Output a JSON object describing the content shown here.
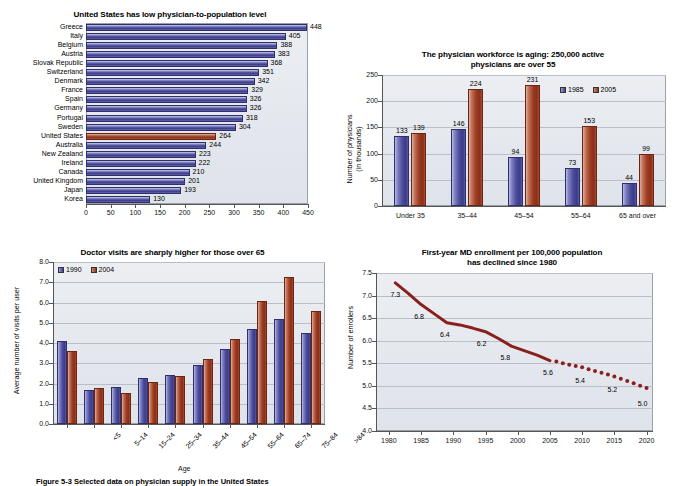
{
  "figure": {
    "caption": "Figure 5-3 Selected data on physician supply in the United States"
  },
  "charts": [
    {
      "id": "chart1",
      "title": "United States has low physician-to-population level",
      "right_axis_note": "",
      "xlabel": "",
      "xticks": [
        "0",
        "50",
        "100",
        "150",
        "200",
        "250",
        "300",
        "350",
        "400",
        "450"
      ]
    },
    {
      "id": "chart2",
      "title_line1": "The physician workforce is aging: 250,000 active",
      "title_line2": "physicians are over 55",
      "ylabel_line1": "Number of physicians",
      "ylabel_line2": "(in thousands)",
      "yticks": [
        "250",
        "200",
        "150",
        "100",
        "50",
        "0"
      ],
      "legend": [
        "1985",
        "2005"
      ]
    },
    {
      "id": "chart3",
      "title": "Doctor visits are sharply higher for those over 65",
      "ylabel": "Average number of visits per user",
      "xlabel": "Age",
      "yticks": [
        "8.0",
        "7.0",
        "6.0",
        "5.0",
        "4.0",
        "3.0",
        "2.0",
        "1.0",
        "0.0"
      ],
      "legend": [
        "1990",
        "2004"
      ]
    },
    {
      "id": "chart4",
      "title_line1": "First-year MD enrollment per 100,000 population",
      "title_line2": "has declined since 1980",
      "ylabel": "Number of enrollers",
      "yticks": [
        "7.5",
        "7.0",
        "6.5",
        "6.0",
        "5.5",
        "5.0",
        "4.5",
        "4.0"
      ],
      "xticks": [
        "1980",
        "1985",
        "1990",
        "1995",
        "2000",
        "2005",
        "2010",
        "2015",
        "2020"
      ]
    }
  ],
  "chart_data": [
    {
      "type": "bar",
      "orientation": "horizontal",
      "title": "United States has low physician-to-population level",
      "xlabel": "",
      "ylabel": "",
      "xlim": [
        0,
        450
      ],
      "grid": false,
      "highlight_category": "United States",
      "highlight_color": "#9d3d24",
      "bar_color": "#4a4a99",
      "categories": [
        "Greece",
        "Italy",
        "Belgium",
        "Austria",
        "Slovak Republic",
        "Switzerland",
        "Denmark",
        "France",
        "Spain",
        "Germany",
        "Portugal",
        "Sweden",
        "United States",
        "Australia",
        "New Zealand",
        "Ireland",
        "Canada",
        "United Kingdom",
        "Japan",
        "Korea"
      ],
      "values": [
        448,
        405,
        388,
        383,
        368,
        351,
        342,
        329,
        326,
        326,
        318,
        304,
        264,
        244,
        223,
        222,
        210,
        201,
        193,
        130
      ],
      "xticks": [
        0,
        50,
        100,
        150,
        200,
        250,
        300,
        350,
        400,
        450
      ]
    },
    {
      "type": "bar",
      "orientation": "vertical",
      "title": "The physician workforce is aging: 250,000 active physicians are over 55",
      "xlabel": "",
      "ylabel": "Number of physicians (in thousands)",
      "ylim": [
        0,
        250
      ],
      "yticks": [
        0,
        50,
        100,
        150,
        200,
        250
      ],
      "grid": true,
      "legend_position": "top-right",
      "categories": [
        "Under 35",
        "35–44",
        "45–54",
        "55–64",
        "65 and over"
      ],
      "series": [
        {
          "name": "1985",
          "color": "#4c4d9c",
          "values": [
            133,
            146,
            94,
            73,
            44
          ]
        },
        {
          "name": "2005",
          "color": "#9c3b22",
          "values": [
            139,
            224,
            231,
            153,
            99
          ]
        }
      ]
    },
    {
      "type": "bar",
      "orientation": "vertical",
      "title": "Doctor visits are sharply higher for those over 65",
      "xlabel": "Age",
      "ylabel": "Average number of visits per user",
      "ylim": [
        0,
        8.0
      ],
      "yticks": [
        0.0,
        1.0,
        2.0,
        3.0,
        4.0,
        5.0,
        6.0,
        7.0,
        8.0
      ],
      "grid": true,
      "legend_position": "top-left",
      "categories": [
        "<5",
        "5–14",
        "15–24",
        "25–34",
        "35–44",
        "45–54",
        "55–64",
        "65–74",
        "75–84",
        ">84"
      ],
      "series": [
        {
          "name": "1990",
          "color": "#4c4d9c",
          "values": [
            4.1,
            1.7,
            1.85,
            2.25,
            2.4,
            2.9,
            3.7,
            4.7,
            5.2,
            4.5
          ]
        },
        {
          "name": "2004",
          "color": "#9c3b22",
          "values": [
            3.6,
            1.8,
            1.55,
            2.05,
            2.35,
            3.2,
            4.2,
            6.05,
            7.25,
            5.6
          ]
        }
      ]
    },
    {
      "type": "line",
      "title": "First-year MD enrollment per 100,000 population has declined since 1980",
      "xlabel": "",
      "ylabel": "Number of enrollers",
      "ylim": [
        4.0,
        7.5
      ],
      "yticks": [
        4.0,
        4.5,
        5.0,
        5.5,
        6.0,
        6.5,
        7.0,
        7.5
      ],
      "xlim": [
        1978,
        2021
      ],
      "xticks": [
        1980,
        1985,
        1990,
        1995,
        2000,
        2005,
        2010,
        2015,
        2020
      ],
      "grid": true,
      "solid_segment": {
        "x": [
          1981,
          1983,
          1985,
          1987,
          1989,
          1991,
          1993,
          1995,
          1997,
          1999,
          2001,
          2003,
          2005
        ],
        "y": [
          7.28,
          7.05,
          6.8,
          6.6,
          6.4,
          6.35,
          6.28,
          6.2,
          6.05,
          5.88,
          5.78,
          5.68,
          5.56
        ]
      },
      "dotted_segment": {
        "x": [
          2006,
          2007,
          2008,
          2009,
          2010,
          2011,
          2012,
          2013,
          2014,
          2015,
          2016,
          2017,
          2018,
          2019,
          2020
        ],
        "y": [
          5.54,
          5.5,
          5.47,
          5.44,
          5.41,
          5.37,
          5.33,
          5.29,
          5.25,
          5.21,
          5.16,
          5.11,
          5.06,
          5.0,
          4.95
        ]
      },
      "line_color": "#8a1f1f",
      "annotations": [
        {
          "label": "7.3",
          "x": 1981
        },
        {
          "label": "6.8",
          "x": 1985
        },
        {
          "label": "6.4",
          "x": 1989
        },
        {
          "label": "6.2",
          "x": 1995
        },
        {
          "label": "5.8",
          "x": 2000
        },
        {
          "label": "5.6",
          "x": 2005
        },
        {
          "label": "5.4",
          "x": 2010
        },
        {
          "label": "5.2",
          "x": 2015
        },
        {
          "label": "5.0",
          "x": 2020
        }
      ]
    }
  ]
}
